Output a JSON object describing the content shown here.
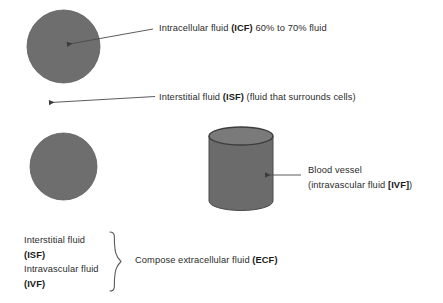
{
  "diagram": {
    "colors": {
      "circle_fill": "#6e6e6e",
      "cylinder_body": "#6b6b6b",
      "cylinder_top_fill": "#7a7a7a",
      "outline": "#3a3a3a",
      "text": "#2b2b2b",
      "arrow": "#4a4a4a",
      "background": "#ffffff"
    },
    "shapes": [
      {
        "name": "cell-circle-top",
        "type": "circle",
        "cx": 63.5,
        "cy": 46.5,
        "r": 36.5
      },
      {
        "name": "cell-circle-bottom",
        "type": "circle",
        "cx": 63.5,
        "cy": 166.5,
        "r": 33.5
      },
      {
        "name": "blood-vessel-cylinder",
        "type": "cylinder",
        "x": 209,
        "y": 128,
        "width": 64,
        "height": 82
      }
    ],
    "arrows": [
      {
        "name": "icf-arrow",
        "from_x": 153,
        "from_y": 29,
        "to_x": 63,
        "to_y": 45
      },
      {
        "name": "isf-arrow",
        "from_x": 155,
        "from_y": 97,
        "to_x": 45,
        "to_y": 103
      },
      {
        "name": "ivf-arrow",
        "from_x": 301,
        "from_y": 175,
        "to_x": 261,
        "to_y": 175
      }
    ],
    "brace": {
      "name": "ecf-brace",
      "x": 118,
      "y_top": 232,
      "y_bottom": 291
    }
  },
  "labels": {
    "icf": {
      "prefix": "Intracellular fluid ",
      "abbrev": "(ICF)",
      "suffix": " 60% to 70% fluid",
      "x": 159,
      "y": 22
    },
    "isf": {
      "prefix": "Interstitial fluid ",
      "abbrev": "(ISF)",
      "suffix": " (fluid that surrounds cells)",
      "x": 159,
      "y": 91
    },
    "blood_vessel": {
      "line1": "Blood vessel",
      "line2_prefix": "(intravascular fluid ",
      "line2_abbrev": "[IVF]",
      "line2_suffix": ")",
      "x": 308,
      "y": 163
    },
    "ecf": {
      "prefix": "Compose extracellular fluid ",
      "abbrev": "(ECF)",
      "suffix": "",
      "x": 135,
      "y": 254
    },
    "brace_list": {
      "x": 24,
      "y": 233,
      "rows": [
        {
          "text": "Interstitial fluid",
          "bold": false
        },
        {
          "text": "(ISF)",
          "bold": true
        },
        {
          "text": "Intravascular fluid",
          "bold": false
        },
        {
          "text": "(IVF)",
          "bold": true
        }
      ]
    }
  }
}
